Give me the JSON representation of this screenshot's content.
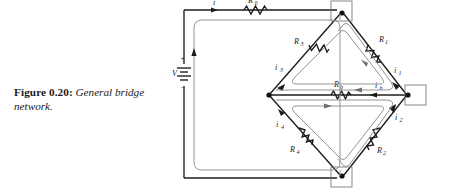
{
  "caption": {
    "label": "Figure 0.20",
    "colon": ":",
    "text": "General bridge network."
  },
  "circuit": {
    "title": "General bridge network",
    "source": {
      "name": "V",
      "plus": "+",
      "minus": "−"
    },
    "components": [
      {
        "name": "R0",
        "label": "R",
        "sub": "0",
        "kind": "resistor",
        "position": "top-outer"
      },
      {
        "name": "R3",
        "label": "R",
        "sub": "3",
        "kind": "resistor",
        "position": "bridge-upper-left"
      },
      {
        "name": "R1",
        "label": "R",
        "sub": "1",
        "kind": "resistor",
        "position": "bridge-upper-right"
      },
      {
        "name": "R4",
        "label": "R",
        "sub": "4",
        "kind": "resistor",
        "position": "bridge-lower-left"
      },
      {
        "name": "R2",
        "label": "R",
        "sub": "2",
        "kind": "resistor",
        "position": "bridge-lower-right"
      },
      {
        "name": "Rb",
        "label": "R",
        "sub": "b",
        "kind": "resistor",
        "position": "bridge-middle"
      }
    ],
    "currents": [
      {
        "name": "i",
        "label": "i",
        "sub": "",
        "position": "top-outer"
      },
      {
        "name": "i3",
        "label": "i",
        "sub": "3",
        "position": "bridge-upper-left"
      },
      {
        "name": "i1",
        "label": "i",
        "sub": "1",
        "position": "bridge-upper-right"
      },
      {
        "name": "i4",
        "label": "i",
        "sub": "4",
        "position": "bridge-lower-left"
      },
      {
        "name": "i2",
        "label": "i",
        "sub": "2",
        "position": "bridge-lower-right"
      },
      {
        "name": "ib",
        "label": "i",
        "sub": "b",
        "position": "bridge-middle"
      }
    ],
    "nodes": [
      {
        "name": "node-top",
        "boxed": true
      },
      {
        "name": "node-right",
        "boxed": true
      },
      {
        "name": "node-bottom",
        "boxed": true
      },
      {
        "name": "node-left",
        "boxed": false
      }
    ],
    "meshes": [
      {
        "name": "outer-mesh",
        "shape": "rounded-rect",
        "direction": "counter-clockwise"
      },
      {
        "name": "upper-mesh",
        "shape": "rounded-triangle",
        "direction": "clockwise"
      },
      {
        "name": "lower-mesh",
        "shape": "rounded-triangle-inverted",
        "direction": "clockwise"
      },
      {
        "name": "right-mesh",
        "shape": "rounded-wedge",
        "direction": "clockwise"
      }
    ]
  },
  "colors": {
    "wire": "#1c1c1c",
    "mesh_loop": "#8e8e8e",
    "node_box": "#7a7a7a",
    "background": "#ffffff",
    "text": "#1a1a1a"
  }
}
